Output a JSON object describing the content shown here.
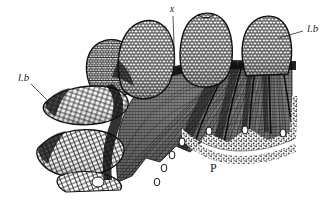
{
  "figure": {
    "kind": "botanical-histology-section",
    "medium": "engraving",
    "background_color": "#ffffff",
    "ink_color": "#1d1d1d",
    "width": 334,
    "height": 200
  },
  "labels": {
    "x": {
      "text": "x",
      "role": "leader-label",
      "position": {
        "x": 172,
        "y": 12
      },
      "leader": {
        "x1": 173,
        "y1": 16,
        "x2": 175,
        "y2": 72
      }
    },
    "lb_right": {
      "text": "l.b",
      "role": "leader-label",
      "position": {
        "x": 307,
        "y": 32
      },
      "leader": {
        "x1": 303,
        "y1": 31,
        "x2": 279,
        "y2": 37
      }
    },
    "lb_left": {
      "text": "l.b",
      "role": "leader-label",
      "position": {
        "x": 18,
        "y": 81
      },
      "leader": {
        "x1": 31,
        "y1": 84,
        "x2": 48,
        "y2": 101
      }
    },
    "p": {
      "text": "P",
      "role": "region-label",
      "position": {
        "x": 210,
        "y": 172
      }
    }
  },
  "regions": {
    "upper_lobes": {
      "name": "upper cellular lobes",
      "label_ref": "l.b",
      "count": 4,
      "texture": "reticulate-cells"
    },
    "left_lobes": {
      "name": "lateral cellular lobes",
      "label_ref": "l.b",
      "count": 3,
      "texture": "elongate-cells"
    },
    "fan": {
      "name": "radiating palisade fan",
      "texture": "fine-radial-hatching",
      "tone": "#4a4a4a"
    },
    "parenchyma": {
      "name": "ground parenchyma",
      "label_ref": "P",
      "texture": "stipple"
    },
    "cavities": {
      "name": "secretory cavities",
      "count": 7,
      "fill": "#ffffff"
    }
  },
  "colors": {
    "ink": "#1d1d1d",
    "mid_gray": "#6a6a6a",
    "dark_gray": "#3a3a3a",
    "light_gray": "#b8b8b8",
    "paper": "#ffffff"
  }
}
